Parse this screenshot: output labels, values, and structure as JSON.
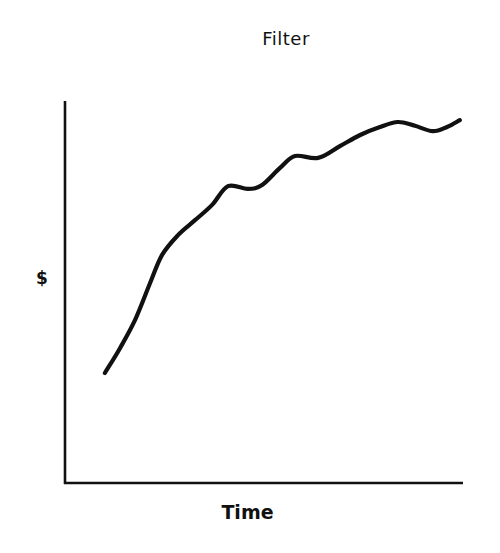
{
  "page": {
    "background": "#ffffff",
    "ink_color": "#111111"
  },
  "chart_data": {
    "type": "line",
    "title": "Filter",
    "xlabel": "Time",
    "ylabel": "$",
    "xlim": [
      0,
      100
    ],
    "ylim": [
      0,
      100
    ],
    "grid": false,
    "legend": null,
    "ticks": {
      "x": [],
      "y": []
    },
    "axis_arrows": false,
    "note": "Stylized sketch with no numeric ticks; values are relative positions (0-100) estimated from pixel locations.",
    "series": [
      {
        "name": "$ over Time",
        "color": "#111111",
        "x": [
          9.8,
          13.6,
          17.4,
          21.2,
          24.2,
          28.2,
          32.5,
          36.8,
          40.8,
          45.8,
          49.4,
          53.9,
          57.7,
          63.5,
          69.0,
          74.1,
          79.1,
          83.6,
          87.9,
          92.4,
          96.0,
          99.2
        ],
        "y": [
          28.8,
          35.3,
          42.7,
          52.4,
          59.7,
          64.9,
          68.8,
          72.8,
          77.7,
          77.0,
          78.0,
          82.5,
          85.6,
          85.1,
          88.2,
          91.1,
          93.2,
          94.5,
          93.5,
          92.1,
          93.2,
          95.0
        ]
      }
    ]
  },
  "layout": {
    "plot_px": {
      "left": 66,
      "right": 463,
      "top": 101,
      "bottom": 483
    }
  }
}
